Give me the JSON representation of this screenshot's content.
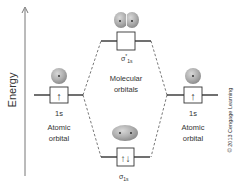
{
  "axis": {
    "label": "Energy"
  },
  "left_atom": {
    "orbital": "1s",
    "label_line1": "Atomic",
    "label_line2": "orbital",
    "electron": "↑"
  },
  "right_atom": {
    "orbital": "1s",
    "label_line1": "Atomic",
    "label_line2": "orbital",
    "electron": "↑"
  },
  "antibonding": {
    "symbol": "σ",
    "superscript": "*",
    "subscript": "1s",
    "electrons": ""
  },
  "bonding": {
    "symbol": "σ",
    "subscript": "1s",
    "electrons": "↑↓"
  },
  "center_label": {
    "line1": "Molecular",
    "line2": "orbitals"
  },
  "copyright": "© 2013 Cengage Learning",
  "colors": {
    "sphere": "#a8a8a8",
    "line": "#222222",
    "dash": "#555555",
    "text": "#333333"
  }
}
